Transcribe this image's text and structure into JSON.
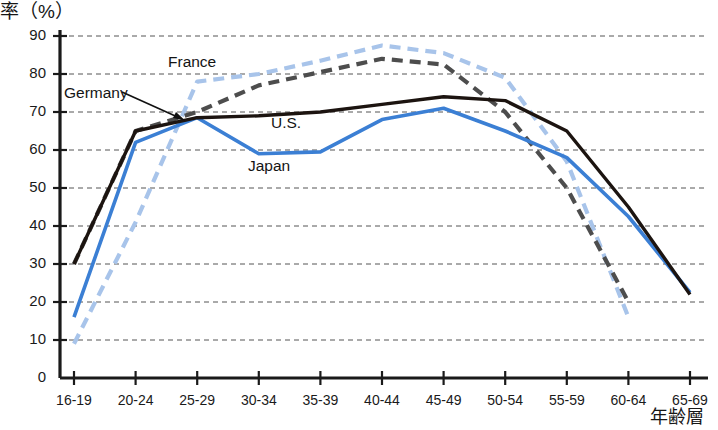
{
  "chart_data": {
    "type": "line",
    "title": "",
    "ylabel": "率（%）",
    "xlabel": "年齢層",
    "ylim": [
      0,
      90
    ],
    "yticks": [
      0,
      10,
      20,
      30,
      40,
      50,
      60,
      70,
      80,
      90
    ],
    "grid": true,
    "legend_position": "inline-annotations",
    "categories": [
      "16-19",
      "20-24",
      "25-29",
      "30-34",
      "35-39",
      "40-44",
      "45-49",
      "50-54",
      "55-59",
      "60-64",
      "65-69"
    ],
    "series": [
      {
        "name": "U.S.",
        "color": "#1c1410",
        "style": "solid",
        "values": [
          30,
          65,
          68.5,
          69,
          70,
          72,
          74,
          73,
          65,
          45,
          22
        ]
      },
      {
        "name": "Japan",
        "color": "#3b7fd4",
        "style": "solid",
        "values": [
          16,
          62,
          68.5,
          59,
          59.5,
          68,
          71,
          65,
          58,
          42.5,
          22.5
        ]
      },
      {
        "name": "Germany",
        "color": "#4d4d4d",
        "style": "dashed",
        "values": [
          30,
          65,
          70,
          77,
          80.5,
          84,
          82.5,
          70,
          50,
          20,
          null
        ]
      },
      {
        "name": "France",
        "color": "#a8c4ea",
        "style": "dashed",
        "values": [
          9,
          41,
          78,
          80,
          83.5,
          87.5,
          85.5,
          79,
          57,
          16,
          null
        ]
      }
    ],
    "annotations": [
      {
        "text": "France",
        "x_px": 168,
        "y_px": 53,
        "arrow": false
      },
      {
        "text": "Germany",
        "x_px": 64,
        "y_px": 84,
        "arrow": true
      },
      {
        "text": "U.S.",
        "x_px": 271,
        "y_px": 114,
        "arrow": false
      },
      {
        "text": "Japan",
        "x_px": 248,
        "y_px": 157,
        "arrow": false
      }
    ]
  },
  "axis": {
    "y_tick_labels": [
      "90",
      "80",
      "70",
      "60",
      "50",
      "40",
      "30",
      "20",
      "10",
      "0"
    ],
    "x_tick_labels": [
      "16-19",
      "20-24",
      "25-29",
      "30-34",
      "35-39",
      "40-44",
      "45-49",
      "50-54",
      "55-59",
      "60-64",
      "65-69"
    ],
    "y_axis_title": "率（%）",
    "x_axis_title": "年齢層"
  },
  "colors": {
    "us_line": "#1c1410",
    "japan_line": "#3b7fd4",
    "germany_line": "#4d4d4d",
    "france_line": "#a8c4ea",
    "axis": "#1a1a1a",
    "grid": "#555555",
    "background": "#ffffff"
  }
}
